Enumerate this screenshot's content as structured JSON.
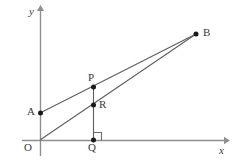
{
  "figure": {
    "background_color": "#ffffff",
    "width": 232,
    "height": 168,
    "axis_color": "#8f8f8f",
    "line_color": "#5a5a5a",
    "point_color": "#1a1a1a",
    "label_color": "#3a3a3a"
  },
  "axes": {
    "x_axis": {
      "label": "x",
      "label_x": 220,
      "label_y": 145,
      "start_x": 22,
      "start_y": 140,
      "end_x": 226,
      "end_y": 140
    },
    "y_axis": {
      "label": "y",
      "label_x": 30,
      "label_y": 6,
      "start_x": 40,
      "start_y": 156,
      "end_x": 40,
      "end_y": 8
    }
  },
  "points": [
    {
      "id": "O",
      "label": "O",
      "x": 40,
      "y": 140,
      "label_x": 26,
      "label_y": 143,
      "dot": false
    },
    {
      "id": "A",
      "label": "A",
      "x": 40,
      "y": 113,
      "label_x": 28,
      "label_y": 107,
      "dot": true
    },
    {
      "id": "P",
      "label": "P",
      "x": 93,
      "y": 87,
      "label_x": 88,
      "label_y": 72,
      "dot": true
    },
    {
      "id": "R",
      "label": "R",
      "x": 93,
      "y": 105,
      "label_x": 98,
      "label_y": 99,
      "dot": true
    },
    {
      "id": "Q",
      "label": "Q",
      "x": 93,
      "y": 140,
      "label_x": 88,
      "label_y": 143,
      "dot": true
    },
    {
      "id": "B",
      "label": "B",
      "x": 196,
      "y": 34,
      "label_x": 203,
      "label_y": 27,
      "dot": true
    }
  ],
  "segments": [
    {
      "id": "AB",
      "from": "A",
      "to": "B",
      "x1": 40,
      "y1": 113,
      "x2": 196,
      "y2": 34
    },
    {
      "id": "OB",
      "from": "O",
      "to": "B",
      "x1": 40,
      "y1": 140,
      "x2": 196,
      "y2": 34
    },
    {
      "id": "PQ",
      "from": "P",
      "to": "Q",
      "x1": 93,
      "y1": 87,
      "x2": 93,
      "y2": 140
    }
  ],
  "right_angle": {
    "at": "Q",
    "size": 8,
    "x": 93,
    "y": 140,
    "direction": "up-right"
  }
}
